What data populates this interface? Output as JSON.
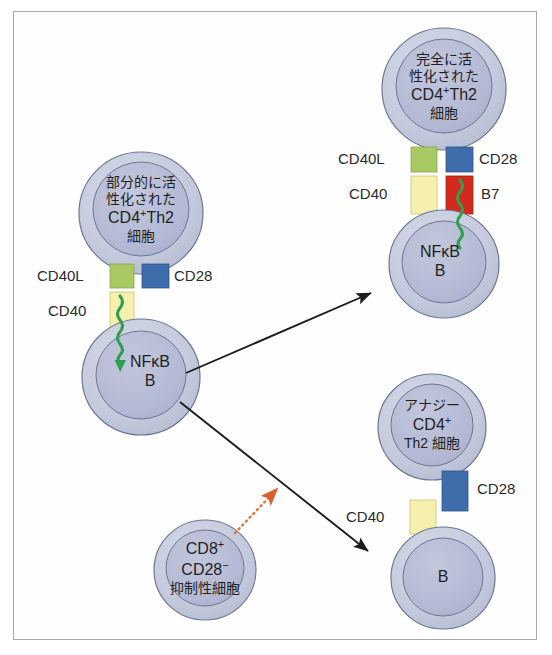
{
  "figure": {
    "background": "#ffffff",
    "frame_color": "#a9a9a9"
  },
  "colors": {
    "cell_outer": "#c3c9dc",
    "cell_inner": "#b3b9d3",
    "cell_stroke": "#6e7694",
    "cd40l_green": "#a9c965",
    "cd28_blue": "#3f6caa",
    "cd40_yellow": "#f5f0ae",
    "b7_red": "#d42a1e",
    "signal_green": "#2f9e4f",
    "arrow_black": "#1c1c1c",
    "arrow_orange": "#e8733c",
    "text": "#2b2b2b"
  },
  "cells": {
    "partially_activated_th2": {
      "name": "partially-activated-th2-cell",
      "lines": [
        "部分的に活",
        "性化された",
        "CD4+Th2",
        "細胞"
      ],
      "line1": "部分的に活",
      "line2": "性化された",
      "line3_base": "CD4",
      "line3_sup": "+",
      "line3_tail": "Th2",
      "line4": "細胞"
    },
    "fully_activated_th2": {
      "name": "fully-activated-th2-cell",
      "line1": "完全に活",
      "line2": "性化された",
      "line3_base": "CD4",
      "line3_sup": "+",
      "line3_tail": "Th2",
      "line4": "細胞"
    },
    "anergic_th2": {
      "name": "anergic-th2-cell",
      "line1": "アナジー",
      "line2_base": "CD4",
      "line2_sup": "+",
      "line3": "Th2 細胞"
    },
    "b_cell_left": {
      "name": "b-cell-left",
      "line1": "NFκB",
      "line2": "B"
    },
    "b_cell_activated": {
      "name": "b-cell-activated",
      "line1": "NFκB",
      "line2": "B"
    },
    "b_cell_unactivated": {
      "name": "b-cell-unactivated",
      "line1": "B"
    },
    "cd8_suppressor": {
      "name": "cd8-suppressor-cell",
      "line1_base": "CD8",
      "line1_sup": "+",
      "line2_base": "CD28",
      "line2_sup": "−",
      "line3": "抑制性細胞"
    }
  },
  "receptor_labels": {
    "left_cd40l": "CD40L",
    "left_cd28": "CD28",
    "left_cd40": "CD40",
    "top_cd40l": "CD40L",
    "top_cd28": "CD28",
    "top_cd40": "CD40",
    "top_b7": "B7",
    "anergy_cd28": "CD28",
    "bottom_cd40": "CD40"
  },
  "arrows": {
    "activation_arrow": "solid-black-arrow-up-right",
    "anergy_arrow": "solid-black-arrow-down-right",
    "suppression_arrow": "orange-dotted-arrow"
  }
}
